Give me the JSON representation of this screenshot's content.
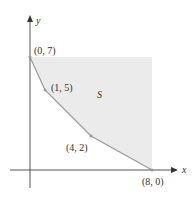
{
  "figure": {
    "region_label": "S",
    "x_axis_label": "x",
    "y_axis_label": "y",
    "points": [
      {
        "label": "(0, 7)",
        "x": 0,
        "y": 7
      },
      {
        "label": "(1, 5)",
        "x": 1,
        "y": 5
      },
      {
        "label": "(4, 2)",
        "x": 4,
        "y": 2
      },
      {
        "label": "(8, 0)",
        "x": 8,
        "y": 0
      }
    ],
    "colors": {
      "region_fill": "#ebebeb",
      "boundary": "#9a9a9a",
      "axis": "#555555"
    }
  }
}
